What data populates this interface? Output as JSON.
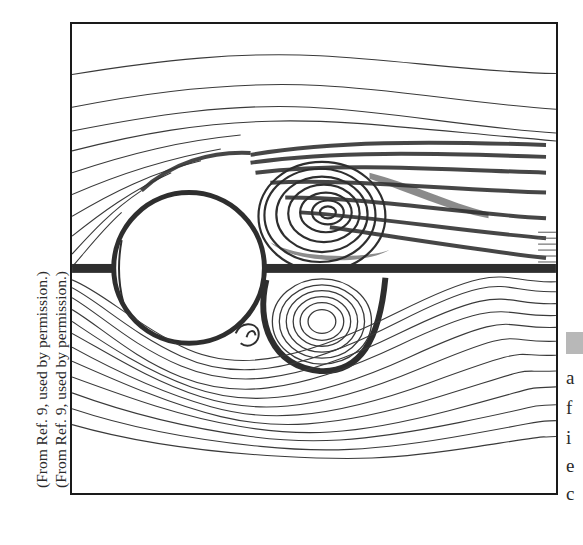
{
  "figure": {
    "credits": [
      "(From Ref. 9, used by permission.)",
      "(From Ref. 9, used by permission.)"
    ],
    "cropped_caption_letters": [
      "a",
      "f",
      "i",
      "e",
      "c"
    ],
    "colors": {
      "line": "#3a3a3a",
      "frame": "#1a1a1a",
      "background": "#ffffff",
      "caption_tab": "#b8b8b8"
    },
    "elements": {
      "cylinder": "white circle at left-centre",
      "upper_vortex": "dense spiral eddy above the wake centreline",
      "lower_vortex": "concentric closed streamline eddy below the wake centreline",
      "wake_band": "dark smeared band extending to the right edge"
    }
  }
}
